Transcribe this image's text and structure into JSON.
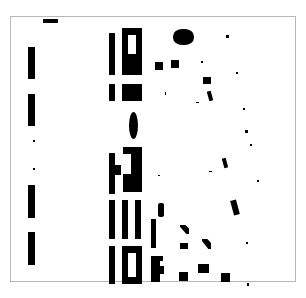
{
  "image": {
    "width": 306,
    "height": 298,
    "background": "#ffffff",
    "foreground": "#000000",
    "frame_color": "#b8b8b8"
  },
  "shapes": [
    {
      "name": "top-dash",
      "x": 43,
      "y": 19,
      "w": 15,
      "h": 4
    },
    {
      "name": "left-bar-1",
      "x": 28,
      "y": 47,
      "w": 7,
      "h": 32
    },
    {
      "name": "left-bar-2",
      "x": 28,
      "y": 94,
      "w": 7,
      "h": 32
    },
    {
      "name": "left-dot-1",
      "x": 33,
      "y": 140,
      "w": 2,
      "h": 2
    },
    {
      "name": "left-dot-2",
      "x": 33,
      "y": 168,
      "w": 2,
      "h": 2
    },
    {
      "name": "left-bar-3",
      "x": 28,
      "y": 185,
      "w": 7,
      "h": 33
    },
    {
      "name": "left-bar-4",
      "x": 28,
      "y": 232,
      "w": 7,
      "h": 33
    },
    {
      "name": "mid-bar-1",
      "x": 109,
      "y": 33,
      "w": 6,
      "h": 42
    },
    {
      "name": "mid-rect-1",
      "x": 122,
      "y": 28,
      "w": 20,
      "h": 47
    },
    {
      "name": "mid-bar-2",
      "x": 109,
      "y": 84,
      "w": 6,
      "h": 17
    },
    {
      "name": "mid-rect-2",
      "x": 122,
      "y": 84,
      "w": 20,
      "h": 17
    },
    {
      "name": "mid-oval",
      "x": 129,
      "y": 112,
      "w": 9,
      "h": 27,
      "radius": "50%"
    },
    {
      "name": "mid-bar-3",
      "x": 109,
      "y": 153,
      "w": 6,
      "h": 41
    },
    {
      "name": "mid-nub",
      "x": 115,
      "y": 165,
      "w": 6,
      "h": 10
    },
    {
      "name": "mid-rect-3",
      "x": 123,
      "y": 147,
      "w": 19,
      "h": 45
    },
    {
      "name": "mid-bar-4",
      "x": 109,
      "y": 200,
      "w": 6,
      "h": 39
    },
    {
      "name": "mid-bar-5",
      "x": 122,
      "y": 200,
      "w": 6,
      "h": 39
    },
    {
      "name": "mid-bar-6",
      "x": 135,
      "y": 200,
      "w": 6,
      "h": 39
    },
    {
      "name": "mid-bar-7",
      "x": 109,
      "y": 246,
      "w": 6,
      "h": 38
    },
    {
      "name": "mid-rect-4",
      "x": 122,
      "y": 246,
      "w": 20,
      "h": 38
    },
    {
      "name": "diamond",
      "x": 173,
      "y": 29,
      "w": 21,
      "h": 16,
      "radius": "45%"
    },
    {
      "name": "dot-a",
      "x": 226,
      "y": 35,
      "w": 3,
      "h": 3
    },
    {
      "name": "square-a",
      "x": 155,
      "y": 62,
      "w": 8,
      "h": 8
    },
    {
      "name": "square-b",
      "x": 171,
      "y": 60,
      "w": 8,
      "h": 8
    },
    {
      "name": "dot-b",
      "x": 201,
      "y": 61,
      "w": 2,
      "h": 2
    },
    {
      "name": "square-c",
      "x": 203,
      "y": 77,
      "w": 8,
      "h": 7
    },
    {
      "name": "dot-c",
      "x": 236,
      "y": 72,
      "w": 2,
      "h": 2
    },
    {
      "name": "slash-a",
      "x": 165,
      "y": 92,
      "w": 1,
      "h": 3
    },
    {
      "name": "bar-d",
      "x": 208,
      "y": 91,
      "w": 4,
      "h": 10,
      "rotate": -15
    },
    {
      "name": "dash-d",
      "x": 196,
      "y": 102,
      "w": 3,
      "h": 1
    },
    {
      "name": "dot-e",
      "x": 243,
      "y": 108,
      "w": 2,
      "h": 2
    },
    {
      "name": "dot-f",
      "x": 245,
      "y": 130,
      "w": 3,
      "h": 3
    },
    {
      "name": "dot-g",
      "x": 250,
      "y": 144,
      "w": 2,
      "h": 2
    },
    {
      "name": "dot-h",
      "x": 158,
      "y": 175,
      "w": 2,
      "h": 1
    },
    {
      "name": "bar-i",
      "x": 223,
      "y": 158,
      "w": 4,
      "h": 10,
      "rotate": -15
    },
    {
      "name": "dash-i",
      "x": 209,
      "y": 171,
      "w": 3,
      "h": 1
    },
    {
      "name": "dot-j",
      "x": 257,
      "y": 180,
      "w": 2,
      "h": 2
    },
    {
      "name": "bar-k",
      "x": 232,
      "y": 200,
      "w": 6,
      "h": 15,
      "rotate": -15
    },
    {
      "name": "pill-l",
      "x": 158,
      "y": 203,
      "w": 6,
      "h": 14,
      "radius": "2px"
    },
    {
      "name": "bar-m",
      "x": 151,
      "y": 219,
      "w": 5,
      "h": 29
    },
    {
      "name": "wedge-n",
      "x": 180,
      "y": 225,
      "w": 9,
      "h": 9,
      "clip": "polygon(0 0, 60% 0, 100% 40%, 100% 100%, 70% 100%, 0 20%)"
    },
    {
      "name": "square-o",
      "x": 180,
      "y": 243,
      "w": 8,
      "h": 6
    },
    {
      "name": "wedge-p",
      "x": 202,
      "y": 239,
      "w": 9,
      "h": 10,
      "clip": "polygon(0 0, 60% 0, 100% 40%, 100% 100%, 70% 100%, 0 20%)"
    },
    {
      "name": "dot-q",
      "x": 246,
      "y": 242,
      "w": 2,
      "h": 2
    },
    {
      "name": "block-r",
      "x": 151,
      "y": 256,
      "w": 9,
      "h": 26
    },
    {
      "name": "block-r-ext",
      "x": 158,
      "y": 266,
      "w": 6,
      "h": 8
    },
    {
      "name": "block-r-nub",
      "x": 160,
      "y": 256,
      "w": 3,
      "h": 5
    },
    {
      "name": "square-s",
      "x": 179,
      "y": 272,
      "w": 9,
      "h": 9
    },
    {
      "name": "square-t",
      "x": 198,
      "y": 264,
      "w": 11,
      "h": 9
    },
    {
      "name": "square-u",
      "x": 221,
      "y": 273,
      "w": 9,
      "h": 9
    },
    {
      "name": "dot-v",
      "x": 247,
      "y": 283,
      "w": 2,
      "h": 3
    }
  ],
  "holes": [
    {
      "name": "mid-rect-1-window",
      "x": 128,
      "y": 35,
      "w": 8,
      "h": 19
    },
    {
      "name": "mid-rect-3-notch",
      "x": 123,
      "y": 154,
      "w": 8,
      "h": 20
    },
    {
      "name": "mid-rect-4-window",
      "x": 128,
      "y": 253,
      "w": 8,
      "h": 24
    }
  ]
}
